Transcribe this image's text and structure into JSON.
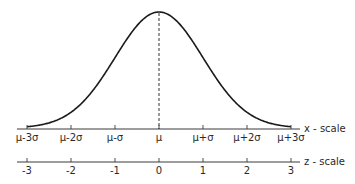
{
  "chart_data": {
    "type": "line",
    "title": "",
    "curve": {
      "function": "normal_pdf",
      "mean_z": 0,
      "sd_z": 1,
      "z_range": [
        -3,
        3
      ],
      "peak_marker": "dashed vertical line at mean"
    },
    "x_scale": {
      "name": "x - scale",
      "ticks": [
        -3,
        -2,
        -1,
        0,
        1,
        2,
        3
      ],
      "tick_labels": [
        "μ-3σ",
        "μ-2σ",
        "μ-σ",
        "μ",
        "μ+σ",
        "μ+2σ",
        "μ+3σ"
      ]
    },
    "z_scale": {
      "name": "z - scale",
      "ticks": [
        -3,
        -2,
        -1,
        0,
        1,
        2,
        3
      ],
      "tick_labels": [
        "-3",
        "-2",
        "-1",
        "0",
        "1",
        "2",
        "3"
      ]
    },
    "xlabel": "x - scale",
    "ylabel": "",
    "grid": false,
    "legend": null
  },
  "colors": {
    "ink": "#1a1a1a",
    "axis": "#3a3a3a",
    "background": "#ffffff"
  }
}
